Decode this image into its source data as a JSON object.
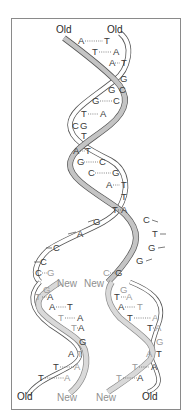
{
  "figure": {
    "type": "dna-replication-diagram",
    "colors": {
      "border": "#8a8a8a",
      "old_strand_fill": "#c4c4c4",
      "old_strand_edge": "#555555",
      "new_strand_fill": "#d9d9d9",
      "base_text": "#3a3a3a",
      "new_base_text": "#9a9a9a"
    },
    "labels": {
      "top_left": "Old",
      "top_right": "Old",
      "fork_left_new": "New",
      "fork_right_new": "New",
      "bottom_left_old": "Old",
      "bottom_left_new": "New",
      "bottom_right_new": "New",
      "bottom_right_old": "Old"
    },
    "parent_helix_pairs": [
      {
        "left": "A",
        "right": "T"
      },
      {
        "left": "T",
        "right": "A"
      },
      {
        "left": "A",
        "right": "T"
      },
      {
        "left": "",
        "right": "G"
      },
      {
        "left": "G",
        "right": "C"
      },
      {
        "left": "G",
        "right": "C"
      },
      {
        "left": "T",
        "right": "A"
      },
      {
        "left": "C",
        "right": "G"
      },
      {
        "left": "T",
        "right": ""
      },
      {
        "left": "A",
        "right": "T"
      },
      {
        "left": "G",
        "right": "C"
      },
      {
        "left": "C",
        "right": "G"
      },
      {
        "left": "A",
        "right": "T"
      },
      {
        "left": "T",
        "right": ""
      },
      {
        "left": "T",
        "right": "A"
      }
    ],
    "fork_left_unpaired": [
      "G",
      "A",
      "C",
      "C",
      "C"
    ],
    "fork_right_unpaired": [
      "C",
      "T",
      "G",
      "G",
      "G"
    ],
    "left_daughter_pairs": [
      {
        "left": "C",
        "right": "G"
      },
      {
        "left": "",
        "right": "G"
      },
      {
        "left": "T",
        "right": "A"
      },
      {
        "left": "A",
        "right": "T"
      },
      {
        "left": "T",
        "right": "A"
      },
      {
        "left": "T",
        "right": "A"
      },
      {
        "left": "",
        "right": "G"
      },
      {
        "left": "A",
        "right": "T"
      },
      {
        "left": "T",
        "right": "A"
      },
      {
        "left": "T",
        "right": "A"
      }
    ],
    "right_daughter_pairs": [
      {
        "left": "C",
        "right": "G"
      },
      {
        "left": "",
        "right": "G"
      },
      {
        "left": "T",
        "right": "A"
      },
      {
        "left": "A",
        "right": "T"
      },
      {
        "left": "T",
        "right": "A"
      },
      {
        "left": "T",
        "right": "A"
      },
      {
        "left": "",
        "right": "G"
      },
      {
        "left": "A",
        "right": "T"
      },
      {
        "left": "T",
        "right": "A"
      },
      {
        "left": "T",
        "right": "A"
      }
    ]
  }
}
